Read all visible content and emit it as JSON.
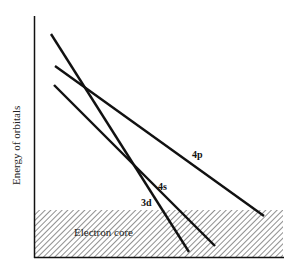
{
  "diagram": {
    "y_axis_label": "Energy of orbitals",
    "core_label": "Electron core",
    "orbitals": [
      {
        "name": "4p",
        "label": "4p"
      },
      {
        "name": "4s",
        "label": "4s"
      },
      {
        "name": "3d",
        "label": "3d"
      }
    ],
    "colors": {
      "line": "#111111",
      "hatch": "#333333",
      "background": "#ffffff"
    }
  }
}
